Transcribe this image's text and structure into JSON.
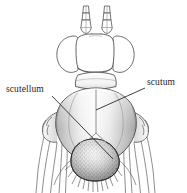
{
  "figure": {
    "background_color": "#ffffff",
    "line_color": "#3a3a3a",
    "label_color": "#232323"
  },
  "labels": [
    {
      "id": "scutellum",
      "text": "scutellum",
      "x": 6,
      "y": 92,
      "anchor": "start",
      "leader": {
        "from_x": 52,
        "from_y": 96,
        "to_x": 113,
        "to_y": 159
      }
    },
    {
      "id": "scutum",
      "text": "scutum",
      "x": 147,
      "y": 85,
      "anchor": "start",
      "leader": {
        "from_x": 145,
        "from_y": 88,
        "to_x": 96,
        "to_y": 110
      }
    }
  ],
  "parts": [
    {
      "id": "antenna-left",
      "name": "left antenna",
      "segments": 3
    },
    {
      "id": "antenna-right",
      "name": "right antenna",
      "segments": 3
    },
    {
      "id": "eye-left",
      "name": "left compound eye"
    },
    {
      "id": "eye-right",
      "name": "right compound eye"
    },
    {
      "id": "head",
      "name": "head capsule"
    },
    {
      "id": "collar",
      "name": "pronotal collar"
    },
    {
      "id": "scutum",
      "name": "scutum"
    },
    {
      "id": "scutellum",
      "name": "scutellum"
    },
    {
      "id": "leg-left",
      "name": "left legs"
    },
    {
      "id": "leg-right",
      "name": "right legs"
    }
  ]
}
